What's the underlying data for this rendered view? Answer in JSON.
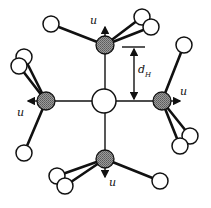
{
  "figure": {
    "colors": {
      "line": "#111111",
      "shaded_fill": "#8a8a8a",
      "open_fill": "#ffffff",
      "background": "#ffffff"
    },
    "labels": {
      "displacement": "u",
      "distance_main": "d",
      "distance_sub": "H"
    },
    "central_atom": {
      "x": 104,
      "y": 101,
      "r": 12
    },
    "shaded_atoms": [
      {
        "id": "top",
        "x": 105,
        "y": 45,
        "r": 9
      },
      {
        "id": "left",
        "x": 46,
        "y": 101,
        "r": 9
      },
      {
        "id": "right",
        "x": 162,
        "y": 101,
        "r": 9
      },
      {
        "id": "bottom",
        "x": 105,
        "y": 159,
        "r": 9
      }
    ]
  }
}
